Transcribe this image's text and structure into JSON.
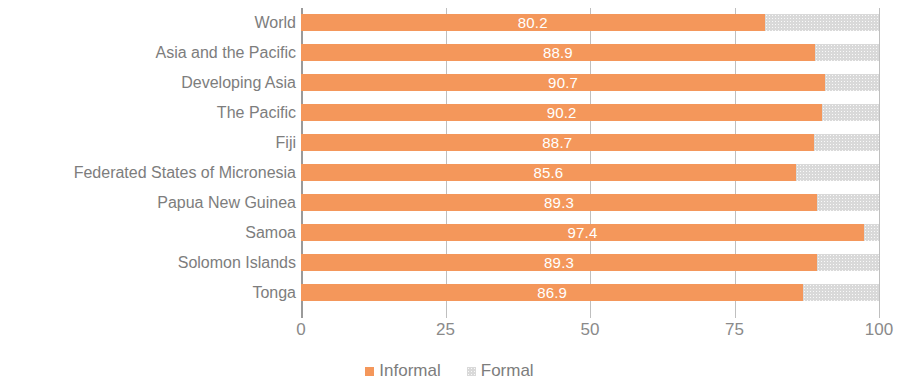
{
  "chart_data": {
    "type": "bar",
    "orientation": "horizontal",
    "stacked": true,
    "stacked_total": 100,
    "title": "",
    "subtitle": "",
    "xlabel": "",
    "ylabel": "",
    "xlim": [
      0,
      100
    ],
    "xticks": [
      "0",
      "25",
      "50",
      "75",
      "100"
    ],
    "xtick_values": [
      0,
      25,
      50,
      75,
      100
    ],
    "grid": true,
    "grid_axis": "x",
    "legend_position": "bottom-center",
    "categories": [
      "World",
      "Asia and the Pacific",
      "Developing Asia",
      "The Pacific",
      "Fiji",
      "Federated States of Micronesia",
      "Papua New Guinea",
      "Samoa",
      "Solomon Islands",
      "Tonga"
    ],
    "series": [
      {
        "name": "Informal",
        "color": "#F4975B",
        "values": [
          80.2,
          88.9,
          90.7,
          90.2,
          88.7,
          85.6,
          89.3,
          97.4,
          89.3,
          86.9
        ],
        "data_labels": [
          "80.2",
          "88.9",
          "90.7",
          "90.2",
          "88.7",
          "85.6",
          "89.3",
          "97.4",
          "89.3",
          "86.9"
        ]
      },
      {
        "name": "Formal",
        "color": "#D9D9D9",
        "values": [
          19.8,
          11.1,
          9.3,
          9.8,
          11.3,
          14.4,
          10.7,
          2.6,
          10.7,
          13.1
        ],
        "data_labels": [
          "",
          "",
          "",
          "",
          "",
          "",
          "",
          "",
          "",
          ""
        ]
      }
    ],
    "legend": [
      {
        "label": "Informal",
        "color": "#F4975B",
        "swatch": "informal"
      },
      {
        "label": "Formal",
        "color": "#D9D9D9",
        "swatch": "formal"
      }
    ]
  },
  "colors": {
    "informal": "#F4975B",
    "formal": "#D9D9D9",
    "label_text": "#7D7D7D",
    "tick_text": "#8A8A8A",
    "value_text": "#FFFFFF",
    "gridline": "#BFBFBF",
    "axis": "#9A9A9A",
    "background": "#FFFFFF"
  }
}
